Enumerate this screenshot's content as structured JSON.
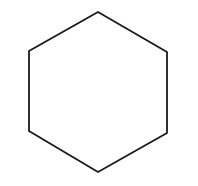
{
  "diagram": {
    "type": "polygon",
    "shape": "hexagon",
    "orientation": "pointy-top",
    "stroke_color": "#1a1a1a",
    "fill_color": "none",
    "stroke_width": 1.8,
    "background": "#ffffff",
    "vertices": [
      {
        "x": 98,
        "y": 12
      },
      {
        "x": 167,
        "y": 52
      },
      {
        "x": 167,
        "y": 133
      },
      {
        "x": 98,
        "y": 172
      },
      {
        "x": 29,
        "y": 131
      },
      {
        "x": 29,
        "y": 51
      }
    ]
  }
}
